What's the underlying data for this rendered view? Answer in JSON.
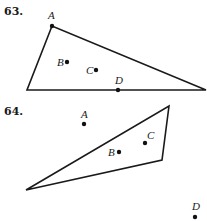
{
  "problems": [
    {
      "number": "63.",
      "triangle": {
        "vertices": [
          [
            52,
            26
          ],
          [
            27,
            90
          ],
          [
            206,
            90
          ]
        ]
      },
      "points": [
        {
          "label": "A",
          "x": 52,
          "y": 26,
          "lx": 48,
          "ly": 19
        },
        {
          "label": "B",
          "x": 67,
          "y": 62,
          "lx": 57,
          "ly": 66
        },
        {
          "label": "C",
          "x": 96,
          "y": 70,
          "lx": 86,
          "ly": 74
        },
        {
          "label": "D",
          "x": 118,
          "y": 90,
          "lx": 115,
          "ly": 84
        }
      ]
    },
    {
      "number": "64.",
      "triangle": {
        "vertices": [
          [
            169,
            106
          ],
          [
            162,
            160
          ],
          [
            26,
            190
          ]
        ]
      },
      "points": [
        {
          "label": "A",
          "x": 84,
          "y": 124,
          "lx": 81,
          "ly": 118
        },
        {
          "label": "B",
          "x": 119,
          "y": 152,
          "lx": 108,
          "ly": 156
        },
        {
          "label": "C",
          "x": 145,
          "y": 143,
          "lx": 147,
          "ly": 139
        },
        {
          "label": "D",
          "x": 195,
          "y": 217,
          "lx": 192,
          "ly": 210
        }
      ]
    }
  ]
}
